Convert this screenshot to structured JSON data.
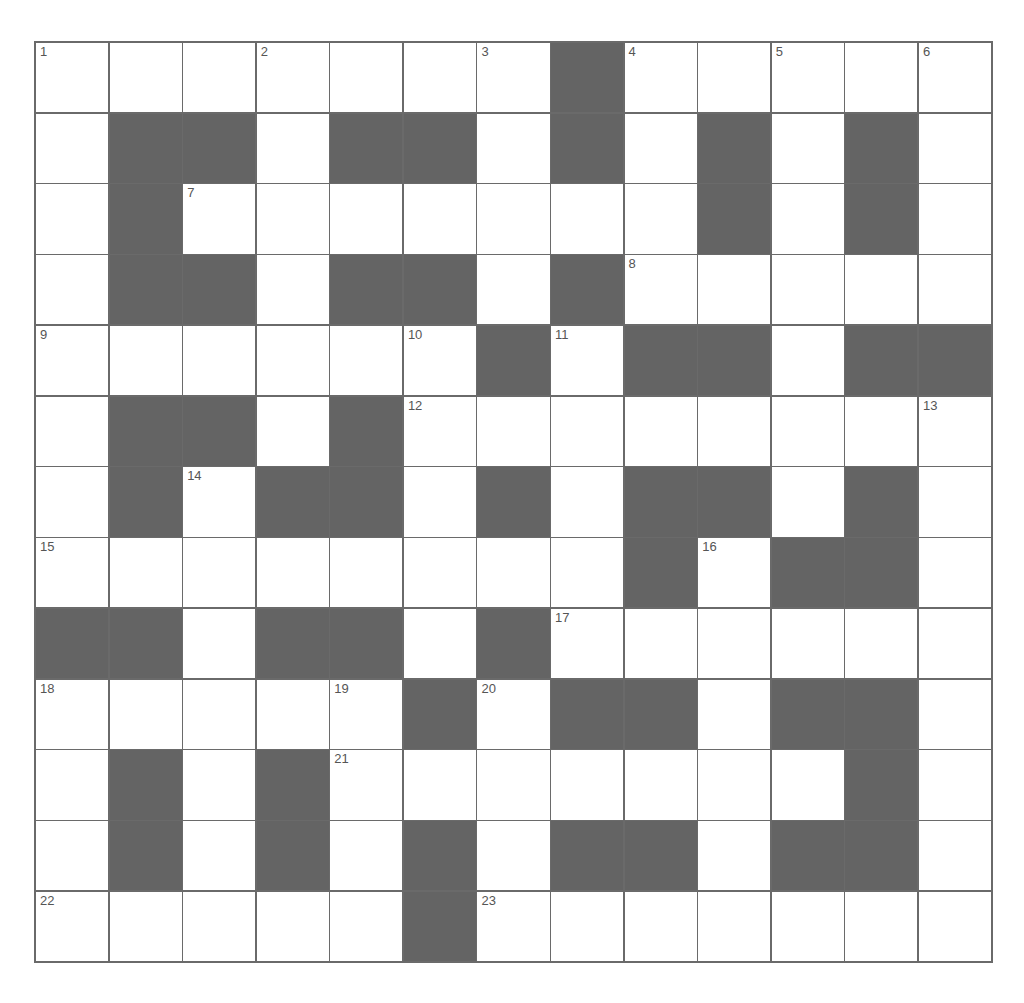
{
  "puzzle": {
    "rows": 13,
    "cols": 13,
    "colors": {
      "block": "#646464",
      "cell": "#ffffff",
      "line": "#6a6a6a",
      "number": "#555555"
    },
    "layout": [
      "....... .....",
      ".  .  . . . .",
      ". ....... . .",
      ".  .  . .....",
      "...... .  .  ",
      ".  . ........",
      ". .  . .  . .",
      "........ .  .",
      "  .  . ......",
      "..... .  .  .",
      ". . ....... .",
      ". . . .  .  .",
      "..... ......."
    ],
    "numbers": [
      {
        "r": 0,
        "c": 0,
        "n": "1"
      },
      {
        "r": 0,
        "c": 3,
        "n": "2"
      },
      {
        "r": 0,
        "c": 6,
        "n": "3"
      },
      {
        "r": 0,
        "c": 8,
        "n": "4"
      },
      {
        "r": 0,
        "c": 10,
        "n": "5"
      },
      {
        "r": 0,
        "c": 12,
        "n": "6"
      },
      {
        "r": 2,
        "c": 2,
        "n": "7"
      },
      {
        "r": 3,
        "c": 8,
        "n": "8"
      },
      {
        "r": 4,
        "c": 0,
        "n": "9"
      },
      {
        "r": 4,
        "c": 5,
        "n": "10"
      },
      {
        "r": 4,
        "c": 7,
        "n": "11"
      },
      {
        "r": 5,
        "c": 5,
        "n": "12"
      },
      {
        "r": 5,
        "c": 12,
        "n": "13"
      },
      {
        "r": 6,
        "c": 2,
        "n": "14"
      },
      {
        "r": 7,
        "c": 0,
        "n": "15"
      },
      {
        "r": 7,
        "c": 9,
        "n": "16"
      },
      {
        "r": 8,
        "c": 7,
        "n": "17"
      },
      {
        "r": 9,
        "c": 0,
        "n": "18"
      },
      {
        "r": 9,
        "c": 4,
        "n": "19"
      },
      {
        "r": 9,
        "c": 6,
        "n": "20"
      },
      {
        "r": 10,
        "c": 4,
        "n": "21"
      },
      {
        "r": 12,
        "c": 0,
        "n": "22"
      },
      {
        "r": 12,
        "c": 6,
        "n": "23"
      }
    ]
  }
}
